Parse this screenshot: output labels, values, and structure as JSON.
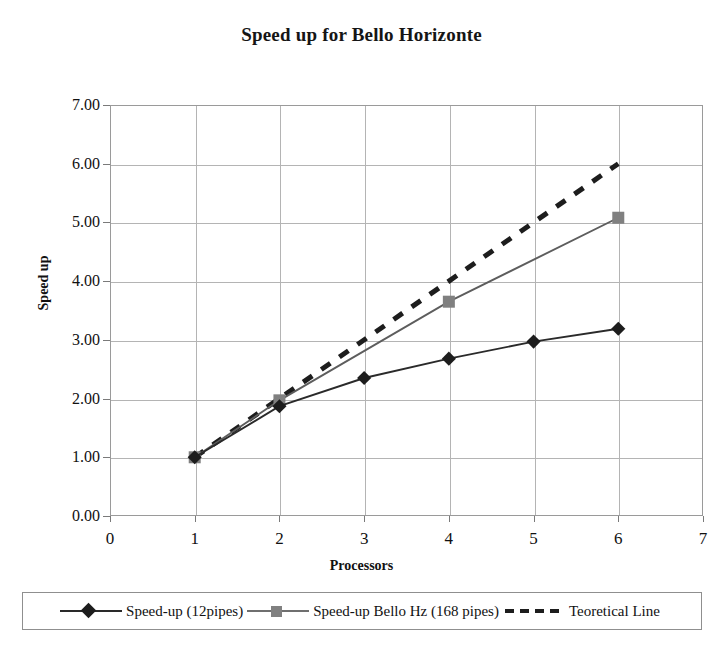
{
  "chart_data": {
    "type": "line",
    "title": "Speed up for Bello Horizonte",
    "xlabel": "Processors",
    "ylabel": "Speed up",
    "xlim": [
      0,
      7
    ],
    "ylim": [
      0,
      7
    ],
    "xticks": [
      "0",
      "1",
      "2",
      "3",
      "4",
      "5",
      "6",
      "7"
    ],
    "yticks": [
      "0.00",
      "1.00",
      "2.00",
      "3.00",
      "4.00",
      "5.00",
      "6.00",
      "7.00"
    ],
    "grid": true,
    "legend_position": "bottom",
    "series": [
      {
        "name": "Speed-up (12pipes)",
        "marker": "diamond",
        "color": "#1d1d1d",
        "line_style": "solid",
        "x": [
          1,
          2,
          3,
          4,
          5,
          6
        ],
        "values": [
          1.0,
          1.87,
          2.35,
          2.68,
          2.97,
          3.19
        ]
      },
      {
        "name": "Speed-up Bello Hz (168 pipes)",
        "marker": "square",
        "color": "#808080",
        "line_style": "solid",
        "x": [
          1,
          2,
          4,
          6
        ],
        "values": [
          1.0,
          1.97,
          3.65,
          5.08
        ]
      },
      {
        "name": "Teoretical Line",
        "marker": "none",
        "color": "#1d1d1d",
        "line_style": "dashed",
        "x": [
          1,
          6
        ],
        "values": [
          1.0,
          6.0
        ]
      }
    ]
  },
  "legend": {
    "items": [
      {
        "label": "Speed-up (12pipes)",
        "marker": "diamond-marker",
        "color": "#1d1d1d"
      },
      {
        "label": "Speed-up Bello Hz (168 pipes)",
        "marker": "square-marker",
        "color": "#808080"
      },
      {
        "label": "Teoretical Line",
        "marker": "dashed-line",
        "color": "#1d1d1d"
      }
    ]
  }
}
